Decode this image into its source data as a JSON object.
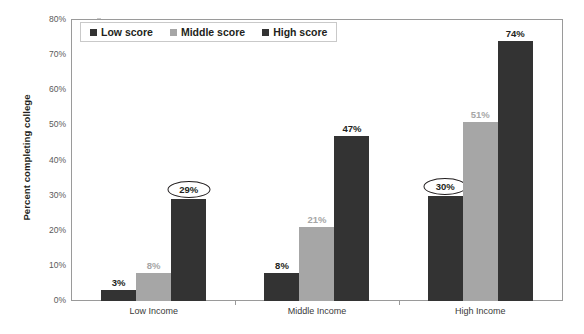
{
  "chart_data": {
    "type": "bar",
    "title": "",
    "xlabel": "",
    "ylabel": "Percent completing college",
    "categories": [
      "Low Income",
      "Middle Income",
      "High Income"
    ],
    "series": [
      {
        "name": "Low score",
        "color": "#333333",
        "values": [
          3,
          8,
          30
        ],
        "labels": [
          "3%",
          "8%",
          "30%"
        ]
      },
      {
        "name": "Middle score",
        "color": "#a6a6a6",
        "values": [
          8,
          21,
          51
        ],
        "labels": [
          "8%",
          "21%",
          "51%"
        ]
      },
      {
        "name": "High score",
        "color": "#333333",
        "values": [
          29,
          47,
          74
        ],
        "labels": [
          "29%",
          "47%",
          "74%"
        ]
      }
    ],
    "ylim": [
      0,
      80
    ],
    "ytick_labels": [
      "80%",
      "70%",
      "60%",
      "50%",
      "40%",
      "30%",
      "20%",
      "10%",
      "0%"
    ],
    "ytick_values": [
      80,
      70,
      60,
      50,
      40,
      30,
      20,
      10,
      0
    ],
    "grid": false,
    "legend_position": "top-left",
    "annotations": [
      {
        "text": "29%",
        "series": "High score",
        "category": "Low Income",
        "style": "ellipse-outline"
      },
      {
        "text": "30%",
        "series": "Low score",
        "category": "High Income",
        "style": "ellipse-outline"
      }
    ]
  },
  "legend": {
    "items": [
      {
        "label": "Low score",
        "swatch": "dark"
      },
      {
        "label": "Middle score",
        "swatch": "gray"
      },
      {
        "label": "High score",
        "swatch": "dark"
      }
    ]
  },
  "colors": {
    "dark_bar": "#333333",
    "gray_bar": "#a6a6a6",
    "axis": "#9a9a9a",
    "text": "#231f20"
  }
}
